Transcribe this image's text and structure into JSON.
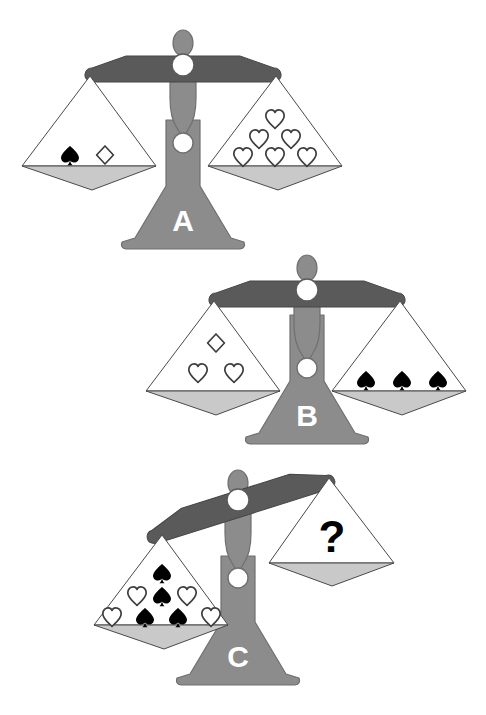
{
  "puzzle": {
    "title": "Balance scale logic puzzle",
    "background_color": "#ffffff",
    "palette": {
      "beam": "#5a5a5a",
      "column": "#8c8c8c",
      "base": "#8c8c8c",
      "pan_dish": "#c9c9c9",
      "pan_outline": "#555555",
      "pivot": "#ffffff",
      "symbol_filled": "#000000",
      "symbol_outline": "#444444",
      "letter": "#ffffff",
      "question_mark": "#000000"
    },
    "symbols": {
      "spade": {
        "name": "spade",
        "glyph": "♠",
        "style": "filled-black"
      },
      "heart": {
        "name": "heart",
        "glyph": "♡",
        "style": "outline"
      },
      "diamond": {
        "name": "diamond",
        "glyph": "♢",
        "style": "outline"
      },
      "question": {
        "name": "question-mark",
        "glyph": "?",
        "style": "filled-black"
      }
    },
    "scales": [
      {
        "id": "A",
        "label": "A",
        "state": "balanced",
        "tilt_degrees": 0,
        "left_pan": {
          "name": "scale-a-left-pan",
          "rows": [
            [
              "spade",
              "diamond"
            ]
          ],
          "counts": {
            "spade": 1,
            "heart": 0,
            "diamond": 1
          },
          "total_items": 2
        },
        "right_pan": {
          "name": "scale-a-right-pan",
          "rows": [
            [
              "heart"
            ],
            [
              "heart",
              "heart"
            ],
            [
              "heart",
              "heart",
              "heart"
            ]
          ],
          "counts": {
            "spade": 0,
            "heart": 6,
            "diamond": 0
          },
          "total_items": 6
        }
      },
      {
        "id": "B",
        "label": "B",
        "state": "balanced",
        "tilt_degrees": 0,
        "left_pan": {
          "name": "scale-b-left-pan",
          "rows": [
            [
              "diamond"
            ],
            [
              "heart",
              "heart"
            ]
          ],
          "counts": {
            "spade": 0,
            "heart": 2,
            "diamond": 1
          },
          "total_items": 3
        },
        "right_pan": {
          "name": "scale-b-right-pan",
          "rows": [
            [
              "spade",
              "spade",
              "spade"
            ]
          ],
          "counts": {
            "spade": 3,
            "heart": 0,
            "diamond": 0
          },
          "total_items": 3
        }
      },
      {
        "id": "C",
        "label": "C",
        "state": "tilted-left-down",
        "tilt_degrees": -18,
        "left_pan": {
          "name": "scale-c-left-pan",
          "rows": [
            [
              "spade"
            ],
            [
              "heart",
              "spade",
              "heart"
            ],
            [
              "heart",
              "spade",
              "spade",
              "heart"
            ]
          ],
          "counts": {
            "spade": 4,
            "heart": 4,
            "diamond": 0
          },
          "total_items": 8
        },
        "right_pan": {
          "name": "scale-c-right-pan",
          "rows": [
            [
              "question"
            ]
          ],
          "counts": {
            "spade": 0,
            "heart": 0,
            "diamond": 0
          },
          "total_items": 1,
          "unknown_marker": "?"
        }
      }
    ]
  }
}
